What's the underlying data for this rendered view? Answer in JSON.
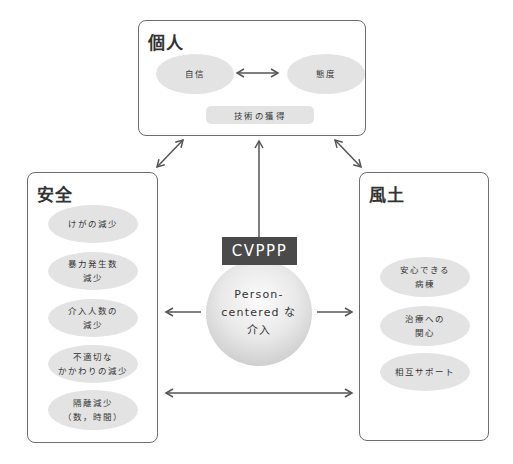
{
  "diagram": {
    "individual": {
      "title": "個人",
      "items": [
        "自信",
        "態度"
      ],
      "bottom_item": "技術の獲得"
    },
    "safety": {
      "title": "安全",
      "items": [
        "けがの減少",
        "暴力発生数\n減少",
        "介入人数の\n減少",
        "不適切な\nかかわりの減少",
        "隔離減少\n（数，時間）"
      ]
    },
    "climate": {
      "title": "風土",
      "items": [
        "安心できる\n病棟",
        "治療への\n関心",
        "相互サポート"
      ]
    },
    "center": {
      "label": "CVPPP",
      "text": "Person-\ncentered な\n介入"
    },
    "colors": {
      "box_border": "#6e6e6e",
      "ellipse_fill": "#e3e3e3",
      "label_fill": "#4a4a4a",
      "arrow": "#555555"
    }
  }
}
